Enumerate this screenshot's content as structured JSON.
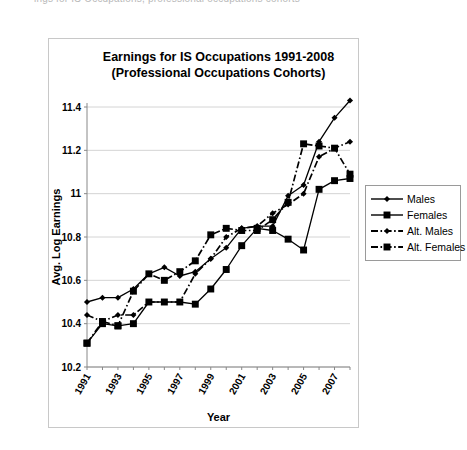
{
  "caption_fragment": "ings for IS Occupations, professional occupations cohorts",
  "chart_data": {
    "type": "line",
    "title_line1": "Earnings for IS Occupations 1991-2008",
    "title_line2": "(Professional Occupations Cohorts)",
    "xlabel": "Year",
    "ylabel": "Avg. Log Earnings",
    "ylim": [
      10.2,
      11.4
    ],
    "ytick_labels": [
      "11.4",
      "11.2",
      "11",
      "10.8",
      "10.6",
      "10.4",
      "10.2"
    ],
    "ytick_values": [
      11.4,
      11.2,
      11.0,
      10.8,
      10.6,
      10.4,
      10.2
    ],
    "grid": true,
    "legend_position": "right",
    "x": [
      1991,
      1992,
      1993,
      1994,
      1995,
      1996,
      1997,
      1998,
      1999,
      2000,
      2001,
      2002,
      2003,
      2004,
      2005,
      2006,
      2007,
      2008
    ],
    "xtick_labels": [
      "1991",
      "",
      "1993",
      "",
      "1995",
      "",
      "1997",
      "",
      "1999",
      "",
      "2001",
      "",
      "2003",
      "",
      "2005",
      "",
      "2007",
      ""
    ],
    "xlim": [
      1991,
      2008
    ],
    "series": [
      {
        "name": "Males",
        "marker": "diamond",
        "dash": "solid",
        "color": "#000000",
        "values": [
          10.5,
          10.52,
          10.52,
          10.56,
          10.63,
          10.66,
          10.62,
          10.64,
          10.7,
          10.75,
          10.84,
          10.85,
          10.85,
          10.99,
          11.04,
          11.24,
          11.35,
          11.43
        ]
      },
      {
        "name": "Females",
        "marker": "square",
        "dash": "solid",
        "color": "#000000",
        "values": [
          10.31,
          10.4,
          10.39,
          10.4,
          10.5,
          10.5,
          10.5,
          10.49,
          10.56,
          10.65,
          10.76,
          10.84,
          10.83,
          10.79,
          10.74,
          11.02,
          11.06,
          11.07
        ]
      },
      {
        "name": "Alt. Males",
        "marker": "diamond",
        "dash": "dashdot",
        "color": "#000000",
        "values": [
          10.44,
          10.41,
          10.44,
          10.44,
          10.5,
          10.5,
          10.5,
          10.63,
          10.7,
          10.8,
          10.84,
          10.85,
          10.91,
          10.95,
          11.0,
          11.17,
          11.21,
          11.24
        ]
      },
      {
        "name": "Alt. Females",
        "marker": "square",
        "dash": "dashdot",
        "color": "#000000",
        "values": [
          10.31,
          10.41,
          10.39,
          10.55,
          10.63,
          10.6,
          10.64,
          10.69,
          10.81,
          10.84,
          10.83,
          10.83,
          10.88,
          10.96,
          11.23,
          11.22,
          11.21,
          11.09
        ]
      }
    ],
    "series_alt_display": [
      {
        "name": "Males",
        "values": [
          10.5,
          10.52,
          10.52,
          10.56,
          10.63,
          10.66,
          10.62,
          10.64,
          10.7,
          10.75,
          10.84,
          10.85,
          10.85,
          10.99,
          11.04,
          11.24,
          11.35,
          11.43
        ]
      },
      {
        "name": "Females",
        "values": [
          10.31,
          10.4,
          10.39,
          10.4,
          10.5,
          10.5,
          10.5,
          10.49,
          10.56,
          10.65,
          10.76,
          10.84,
          10.83,
          10.79,
          10.74,
          11.02,
          11.06,
          11.07
        ]
      },
      {
        "name": "Alt. Males",
        "values": [
          10.44,
          10.41,
          10.44,
          10.44,
          10.5,
          10.5,
          10.5,
          10.63,
          10.7,
          10.8,
          10.84,
          10.85,
          10.91,
          10.95,
          11.0,
          11.17,
          11.21,
          11.24
        ]
      },
      {
        "name": "Alt. Females",
        "values": [
          10.31,
          10.41,
          10.39,
          10.55,
          10.63,
          10.6,
          10.64,
          10.69,
          10.81,
          10.84,
          10.83,
          10.83,
          10.88,
          10.96,
          11.23,
          11.22,
          11.21,
          11.09
        ]
      }
    ]
  },
  "legend": {
    "items": [
      {
        "label": "Males",
        "marker": "diamond",
        "dash": "solid"
      },
      {
        "label": "Females",
        "marker": "square",
        "dash": "solid"
      },
      {
        "label": "Alt. Males",
        "marker": "diamond",
        "dash": "dashdot"
      },
      {
        "label": "Alt. Females",
        "marker": "square",
        "dash": "dashdot"
      }
    ]
  }
}
